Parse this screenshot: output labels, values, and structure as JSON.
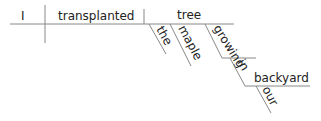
{
  "diagram": {
    "type": "sentence-diagram",
    "sentence": "I transplanted the maple tree growing in our backyard",
    "subject": "I",
    "verb": "transplanted",
    "direct_object": "tree",
    "modifiers_of_object": [
      "the",
      "maple",
      "growing"
    ],
    "participle_phrase": {
      "participle": "growing",
      "preposition": "in",
      "object_of_preposition": "backyard",
      "modifier": "our"
    },
    "colors": {
      "line": "#888888",
      "text": "#222222"
    }
  }
}
